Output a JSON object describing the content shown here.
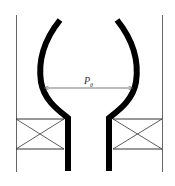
{
  "diagram": {
    "type": "mechanical cross-section schematic",
    "dimension_label": {
      "main": "P",
      "subscript": "θ"
    },
    "colors": {
      "background": "#ffffff",
      "stroke": "#000000",
      "thin_line": "#555555",
      "label": "#333333"
    },
    "elements": [
      "left-wall-line",
      "right-wall-line",
      "left-curved-tube",
      "right-curved-tube",
      "dimension-arrow",
      "left-support-block",
      "right-support-block"
    ]
  }
}
